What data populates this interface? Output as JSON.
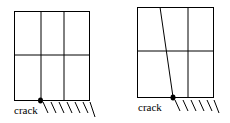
{
  "diagrams": [
    {
      "id": "before",
      "crack_label": "crack"
    },
    {
      "id": "after",
      "crack_label": "crack"
    }
  ]
}
